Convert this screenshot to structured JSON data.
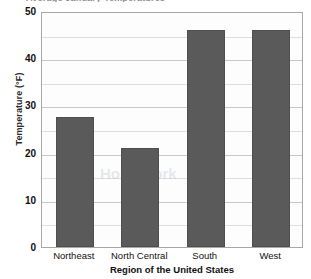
{
  "chart_data": {
    "type": "bar",
    "title": "",
    "xlabel": "Region of the United States",
    "ylabel": "Temperature (°F)",
    "categories": [
      "Northeast",
      "North Central",
      "South",
      "West"
    ],
    "values": [
      27.5,
      21,
      46,
      46
    ],
    "ylim": [
      0,
      50
    ],
    "ytick_labels": [
      "0",
      "10",
      "20",
      "30",
      "40",
      "50"
    ],
    "ytick_values": [
      0,
      10,
      20,
      30,
      40,
      50
    ],
    "gridline_values": [
      5,
      10,
      15,
      20,
      25,
      30,
      35,
      40,
      45,
      50
    ],
    "grid": true,
    "legend": "none",
    "bar_color": "#5a5a5a",
    "plot_background": "#fdfdfd",
    "gridline_color": "#dedede",
    "axis_border_color": "#a8a8a8"
  },
  "axes": {
    "y_title": "Temperature (°F)",
    "x_title": "Region of the United States"
  },
  "title_sliver": {
    "text": "Average January Temperatures"
  }
}
